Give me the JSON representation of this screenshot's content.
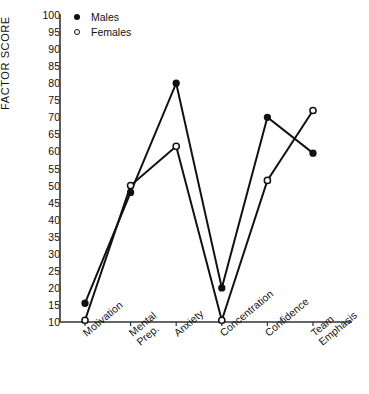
{
  "chart_data": {
    "type": "line",
    "title": "",
    "xlabel": "",
    "ylabel": "FACTOR SCORE",
    "categories": [
      "Motivation",
      "Mental\nPrep.",
      "Anxiety",
      "Concentration",
      "Confidence",
      "Team\nEmphasis"
    ],
    "ylim": [
      10,
      100
    ],
    "yticks": [
      100,
      95,
      90,
      85,
      80,
      75,
      70,
      65,
      60,
      55,
      50,
      45,
      40,
      35,
      30,
      25,
      20,
      15,
      10
    ],
    "grid": false,
    "legend_position": "top-left",
    "series": [
      {
        "name": "Males",
        "marker": "filled-circle",
        "color": "#111111",
        "values": [
          15.5,
          48,
          80,
          20,
          70,
          59.5
        ]
      },
      {
        "name": "Females",
        "marker": "open-circle",
        "color": "#111111",
        "values": [
          10.5,
          50,
          61.5,
          10.5,
          51.5,
          72
        ]
      }
    ]
  },
  "legend": {
    "males_label": "Males",
    "females_label": "Females"
  },
  "axis": {
    "y_title": "FACTOR SCORE"
  }
}
